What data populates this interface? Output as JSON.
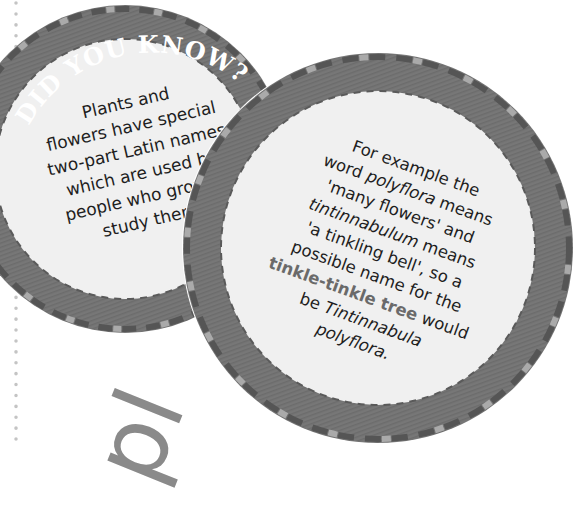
{
  "page": {
    "background": "#ffffff",
    "dotted_rule_color": "#bdbdbd"
  },
  "badge_left": {
    "title": "DID YOU KNOW?",
    "lines": [
      "Plants and",
      "flowers have special",
      "two-part Latin names",
      "which are used by",
      "people who grow or",
      "study them."
    ],
    "colors": {
      "ring": "#777777",
      "disc": "#f0f0f0",
      "dash_dark": "#555555",
      "dash_light": "#aaaaaa"
    }
  },
  "badge_right": {
    "lines": {
      "l1": "For example the",
      "l2a": "word ",
      "l2b": "polyflora",
      "l2c": " means",
      "l3": "'many flowers' and",
      "l4a": "tintinnabulum",
      "l4b": " means",
      "l5": "'a tinkling bell', so a",
      "l6": "possible name for the",
      "l7a": "tinkle-tinkle tree",
      "l7b": " would",
      "l8a": "be ",
      "l8b": "Tintinnabula",
      "l9": "polyflora."
    },
    "highlight_color": "#6a6a6a"
  },
  "decor": {
    "rotated_letters": "pl"
  }
}
